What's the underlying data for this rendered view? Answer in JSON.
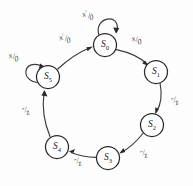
{
  "diagram": {
    "type": "mealy-state-machine",
    "title": "",
    "background_color": "#fdfdfd",
    "stroke_color": "#2b2b2b",
    "label_color": "#3d3d3d",
    "state_radius": 11.5,
    "ring_center": [
      97,
      100
    ],
    "ring_radius": 57,
    "states": [
      {
        "id": "S0",
        "name": "S",
        "sub": "0",
        "cx": 105,
        "cy": 45
      },
      {
        "id": "S1",
        "name": "S",
        "sub": "1",
        "cx": 156,
        "cy": 72
      },
      {
        "id": "S2",
        "name": "S",
        "sub": "2",
        "cx": 152,
        "cy": 125
      },
      {
        "id": "S3",
        "name": "S",
        "sub": "3",
        "cx": 108,
        "cy": 158
      },
      {
        "id": "S4",
        "name": "S",
        "sub": "4",
        "cx": 57,
        "cy": 147
      },
      {
        "id": "S5",
        "name": "S",
        "sub": "5",
        "cx": 48,
        "cy": 77
      }
    ],
    "transitions": [
      {
        "id": "t-s0-s0",
        "from": "S0",
        "to": "S0",
        "kind": "self-loop",
        "input": "x",
        "prime": true,
        "output": "0",
        "label_x": 88,
        "label_y": 15
      },
      {
        "id": "t-s0-s1",
        "from": "S0",
        "to": "S1",
        "kind": "arc",
        "input": "x",
        "prime": false,
        "output": "0",
        "label_x": 137,
        "label_y": 40
      },
      {
        "id": "t-s1-s2",
        "from": "S1",
        "to": "S2",
        "kind": "arc",
        "input": "-",
        "prime": false,
        "output": "z",
        "label_x": 175,
        "label_y": 100
      },
      {
        "id": "t-s2-s3",
        "from": "S2",
        "to": "S3",
        "kind": "arc",
        "input": "-",
        "prime": false,
        "output": "z",
        "label_x": 144,
        "label_y": 153
      },
      {
        "id": "t-s3-s4",
        "from": "S3",
        "to": "S4",
        "kind": "arc",
        "input": "-",
        "prime": false,
        "output": "z",
        "label_x": 78,
        "label_y": 160
      },
      {
        "id": "t-s4-s5",
        "from": "S4",
        "to": "S5",
        "kind": "arc",
        "input": "-",
        "prime": false,
        "output": "z",
        "label_x": 26,
        "label_y": 110
      },
      {
        "id": "t-s5-s5",
        "from": "S5",
        "to": "S5",
        "kind": "self-loop",
        "input": "x",
        "prime": false,
        "output": "0",
        "label_x": 14,
        "label_y": 57
      },
      {
        "id": "t-s5-s0",
        "from": "S5",
        "to": "S0",
        "kind": "arc",
        "input": "x",
        "prime": true,
        "output": "0",
        "label_x": 65,
        "label_y": 38
      }
    ]
  }
}
